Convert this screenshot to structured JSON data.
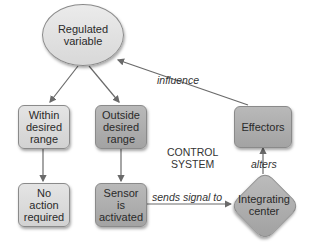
{
  "diagram": {
    "title": "CONTROL SYSTEM",
    "nodes": {
      "regulated": {
        "line1": "Regulated",
        "line2": "variable"
      },
      "within": {
        "line1": "Within",
        "line2": "desired",
        "line3": "range"
      },
      "outside": {
        "line1": "Outside",
        "line2": "desired",
        "line3": "range"
      },
      "no_action": {
        "line1": "No",
        "line2": "action",
        "line3": "required"
      },
      "sensor": {
        "line1": "Sensor",
        "line2": "is",
        "line3": "activated"
      },
      "integrating": {
        "line1": "Integrating",
        "line2": "center"
      },
      "effectors": {
        "line1": "Effectors"
      }
    },
    "edges": {
      "influence": "influence",
      "sends_signal": "sends signal to",
      "alters": "alters"
    },
    "title_lines": {
      "line1": "CONTROL",
      "line2": "SYSTEM"
    },
    "colors": {
      "light_fill": "#d9d9d9",
      "dark_fill": "#adadad",
      "stroke": "#8a8a8a",
      "arrow": "#6a6a6a"
    }
  }
}
